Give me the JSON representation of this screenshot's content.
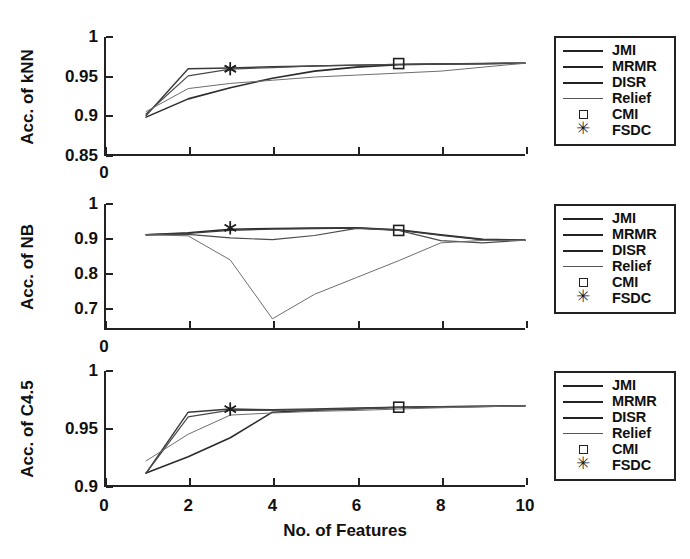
{
  "figure": {
    "xlabel": "No. of Features",
    "x_ticks": [
      "0",
      "2",
      "4",
      "6",
      "8",
      "10"
    ]
  },
  "legend": {
    "items": [
      {
        "label": "JMI",
        "marker": "line",
        "style": "solid-dark"
      },
      {
        "label": "MRMR",
        "marker": "line",
        "style": "solid-dark"
      },
      {
        "label": "DISR",
        "marker": "line",
        "style": "solid-dark"
      },
      {
        "label": "Relief",
        "marker": "line",
        "style": "solid-thin"
      },
      {
        "label": "CMI",
        "marker": "square",
        "style": "open-square"
      },
      {
        "label": "FSDC",
        "marker": "star",
        "style": "asterisk"
      }
    ]
  },
  "panels": [
    {
      "id": "knn",
      "ylabel": "Acc. of kNN",
      "y_ticks": [
        "0.85",
        "0.9",
        "0.95",
        "1"
      ]
    },
    {
      "id": "nb",
      "ylabel": "Acc. of NB",
      "y_ticks": [
        "0.7",
        "0.8",
        "0.9",
        "1"
      ]
    },
    {
      "id": "c45",
      "ylabel": "Acc. of C4.5",
      "y_ticks": [
        "0.9",
        "0.95",
        "1"
      ]
    }
  ],
  "chart_data": [
    {
      "type": "line",
      "title": "Acc. of kNN",
      "xlabel": "No. of Features",
      "ylabel": "Acc. of kNN",
      "xlim": [
        0,
        10
      ],
      "ylim": [
        0.85,
        1.0
      ],
      "x_ticks": [
        0,
        2,
        4,
        6,
        8,
        10
      ],
      "y_ticks": [
        0.85,
        0.9,
        0.95,
        1.0
      ],
      "grid": false,
      "legend_position": "right-outside",
      "x": [
        1,
        2,
        3,
        4,
        5,
        6,
        7,
        8,
        9,
        10
      ],
      "series": [
        {
          "name": "JMI",
          "values": [
            0.899,
            0.922,
            0.936,
            0.948,
            0.957,
            0.962,
            0.965,
            0.966,
            0.9665,
            0.967
          ]
        },
        {
          "name": "MRMR",
          "values": [
            0.901,
            0.96,
            0.961,
            0.9625,
            0.9635,
            0.9645,
            0.9655,
            0.966,
            0.9665,
            0.967
          ]
        },
        {
          "name": "DISR",
          "values": [
            0.903,
            0.951,
            0.9595,
            0.9615,
            0.9635,
            0.9645,
            0.9655,
            0.966,
            0.9665,
            0.967
          ]
        },
        {
          "name": "Relief",
          "values": [
            0.906,
            0.935,
            0.9415,
            0.9455,
            0.9495,
            0.952,
            0.9545,
            0.957,
            0.962,
            0.967
          ]
        }
      ],
      "markers": [
        {
          "name": "CMI",
          "x": 7,
          "y": 0.9665
        },
        {
          "name": "FSDC",
          "x": 3,
          "y": 0.96
        }
      ]
    },
    {
      "type": "line",
      "title": "Acc. of NB",
      "xlabel": "No. of Features",
      "ylabel": "Acc. of NB",
      "xlim": [
        0,
        10
      ],
      "ylim": [
        0.64,
        1.0
      ],
      "x_ticks": [
        0,
        2,
        4,
        6,
        8,
        10
      ],
      "y_ticks": [
        0.7,
        0.8,
        0.9,
        1.0
      ],
      "grid": false,
      "legend_position": "right-outside",
      "x": [
        1,
        2,
        3,
        4,
        5,
        6,
        7,
        8,
        9,
        10
      ],
      "series": [
        {
          "name": "JMI",
          "values": [
            0.912,
            0.918,
            0.928,
            0.93,
            0.931,
            0.932,
            0.926,
            0.912,
            0.899,
            0.897
          ]
        },
        {
          "name": "MRMR",
          "values": [
            0.912,
            0.916,
            0.9245,
            0.9285,
            0.93,
            0.9315,
            0.9255,
            0.9105,
            0.898,
            0.896
          ]
        },
        {
          "name": "DISR",
          "values": [
            0.912,
            0.913,
            0.903,
            0.898,
            0.91,
            0.9305,
            0.9245,
            0.8955,
            0.889,
            0.897
          ]
        },
        {
          "name": "Relief",
          "values": [
            0.912,
            0.909,
            0.84,
            0.672,
            0.742,
            0.79,
            0.838,
            0.889,
            0.896,
            0.896
          ]
        }
      ],
      "markers": [
        {
          "name": "CMI",
          "x": 7,
          "y": 0.9245
        },
        {
          "name": "FSDC",
          "x": 3,
          "y": 0.932
        }
      ]
    },
    {
      "type": "line",
      "title": "Acc. of C4.5",
      "xlabel": "No. of Features",
      "ylabel": "Acc. of C4.5",
      "xlim": [
        0,
        10
      ],
      "ylim": [
        0.9,
        1.0
      ],
      "x_ticks": [
        0,
        2,
        4,
        6,
        8,
        10
      ],
      "y_ticks": [
        0.9,
        0.95,
        1.0
      ],
      "grid": false,
      "legend_position": "right-outside",
      "x": [
        1,
        2,
        3,
        4,
        5,
        6,
        7,
        8,
        9,
        10
      ],
      "series": [
        {
          "name": "JMI",
          "values": [
            0.912,
            0.926,
            0.9425,
            0.9645,
            0.9662,
            0.9672,
            0.9688,
            0.9692,
            0.9695,
            0.97
          ]
        },
        {
          "name": "MRMR",
          "values": [
            0.912,
            0.9645,
            0.9672,
            0.9667,
            0.9672,
            0.9682,
            0.9688,
            0.9692,
            0.9695,
            0.97
          ]
        },
        {
          "name": "DISR",
          "values": [
            0.912,
            0.9605,
            0.9662,
            0.966,
            0.9665,
            0.9675,
            0.9685,
            0.969,
            0.9695,
            0.97
          ]
        },
        {
          "name": "Relief",
          "values": [
            0.9225,
            0.9455,
            0.962,
            0.9638,
            0.9652,
            0.966,
            0.9672,
            0.9683,
            0.9692,
            0.97
          ]
        }
      ],
      "markers": [
        {
          "name": "CMI",
          "x": 7,
          "y": 0.9688
        },
        {
          "name": "FSDC",
          "x": 3,
          "y": 0.9672
        }
      ]
    }
  ]
}
